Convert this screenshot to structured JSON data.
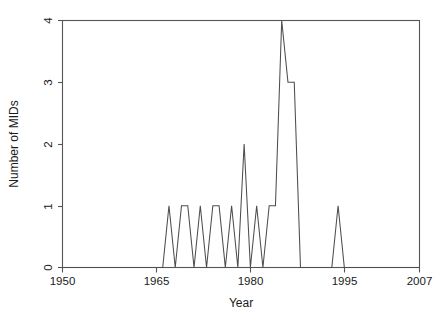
{
  "chart_data": {
    "type": "line",
    "title": "",
    "xlabel": "Year",
    "ylabel": "Number of MIDs",
    "xlim": [
      1950,
      2007
    ],
    "ylim": [
      0,
      4
    ],
    "grid": false,
    "legend": null,
    "xticks": [
      1950,
      1965,
      1980,
      1995,
      2007
    ],
    "xticklabels": [
      "1950",
      "1965",
      "1980",
      "1995",
      "2007"
    ],
    "yticks": [
      0,
      1,
      2,
      3,
      4
    ],
    "yticklabels": [
      "0",
      "1",
      "2",
      "3",
      "4"
    ],
    "line_color": "#4d4d4d",
    "x": [
      1950,
      1951,
      1952,
      1953,
      1954,
      1955,
      1956,
      1957,
      1958,
      1959,
      1960,
      1961,
      1962,
      1963,
      1964,
      1965,
      1966,
      1967,
      1968,
      1969,
      1970,
      1971,
      1972,
      1973,
      1974,
      1975,
      1976,
      1977,
      1978,
      1979,
      1980,
      1981,
      1982,
      1983,
      1984,
      1985,
      1986,
      1987,
      1988,
      1989,
      1990,
      1991,
      1992,
      1993,
      1994,
      1995,
      1996,
      1997,
      1998,
      1999,
      2000,
      2001,
      2002,
      2003,
      2004,
      2005,
      2006,
      2007
    ],
    "values": [
      0,
      0,
      0,
      0,
      0,
      0,
      0,
      0,
      0,
      0,
      0,
      0,
      0,
      0,
      0,
      0,
      0,
      1,
      0,
      1,
      1,
      0,
      1,
      0,
      1,
      1,
      0,
      1,
      0,
      2,
      0,
      1,
      0,
      1,
      1,
      4,
      3,
      3,
      0,
      0,
      0,
      0,
      0,
      0,
      1,
      0,
      0,
      0,
      0,
      0,
      0,
      0,
      0,
      0,
      0,
      0,
      0,
      0
    ],
    "series": [
      {
        "name": "Number of MIDs",
        "values": [
          0,
          0,
          0,
          0,
          0,
          0,
          0,
          0,
          0,
          0,
          0,
          0,
          0,
          0,
          0,
          0,
          0,
          1,
          0,
          1,
          1,
          0,
          1,
          0,
          1,
          1,
          0,
          1,
          0,
          2,
          0,
          1,
          0,
          1,
          1,
          4,
          3,
          3,
          0,
          0,
          0,
          0,
          0,
          0,
          1,
          0,
          0,
          0,
          0,
          0,
          0,
          0,
          0,
          0,
          0,
          0,
          0,
          0
        ]
      }
    ]
  },
  "axes": {
    "x_title": "Year",
    "y_title": "Number of MIDs",
    "x_tick_labels": [
      "1950",
      "1965",
      "1980",
      "1995",
      "2007"
    ],
    "y_tick_labels": [
      "0",
      "1",
      "2",
      "3",
      "4"
    ]
  }
}
